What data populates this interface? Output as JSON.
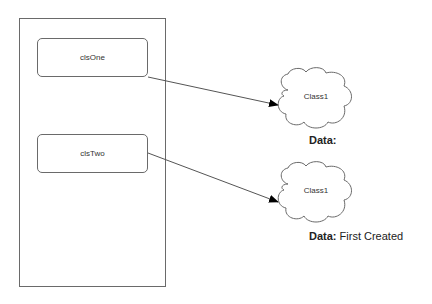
{
  "diagram": {
    "container": {
      "label": ""
    },
    "boxes": [
      {
        "id": "box1",
        "label": "clsOne"
      },
      {
        "id": "box2",
        "label": "clsTwo"
      }
    ],
    "clouds": [
      {
        "id": "cloud1",
        "label": "Class1",
        "data_key": "Data:",
        "data_value": ""
      },
      {
        "id": "cloud2",
        "label": "Class1",
        "data_key": "Data:",
        "data_value": "First Created"
      }
    ],
    "edges": [
      {
        "from": "clsOne",
        "to": "cloud1"
      },
      {
        "from": "clsTwo",
        "to": "cloud2"
      }
    ],
    "colors": {
      "stroke": "#6a6a6a",
      "arrow": "#000000",
      "text": "#333333"
    }
  }
}
